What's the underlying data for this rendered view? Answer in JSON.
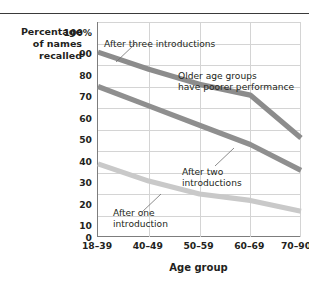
{
  "y_axis": {
    "label_lines": [
      "Percentage",
      "of names",
      "recalled"
    ],
    "ticks": [
      "100%",
      "90",
      "80",
      "70",
      "60",
      "50",
      "40",
      "30",
      "20",
      "10",
      "0"
    ]
  },
  "x_axis": {
    "title": "Age group",
    "ticks": [
      "18–39",
      "40–49",
      "50–59",
      "60–69",
      "70–90"
    ]
  },
  "annotations": {
    "three": "After three introductions",
    "older_line1": "Older age groups",
    "older_line2": "have poorer performance",
    "two_line1": "After two",
    "two_line2": "introductions",
    "one_line1": "After one",
    "one_line2": "introduction"
  },
  "colors": {
    "series_three": "#8c8c8c",
    "series_two": "#8f8f8f",
    "series_one": "#c9c9c9",
    "grid": "#d4d4d4",
    "axis": "#7d7d7d",
    "text": "#231f20",
    "rule": "#3a3a3a"
  },
  "chart_data": {
    "type": "line",
    "title": "",
    "xlabel": "Age group",
    "ylabel": "Percentage of names recalled",
    "categories": [
      "18–39",
      "40–49",
      "50–59",
      "60–69",
      "70–90"
    ],
    "ylim": [
      0,
      100
    ],
    "yticks": [
      0,
      10,
      20,
      30,
      40,
      50,
      60,
      70,
      80,
      90,
      100
    ],
    "grid": true,
    "legend": "annotations",
    "series": [
      {
        "name": "After three introductions",
        "values": [
          86,
          78,
          71,
          66,
          46
        ],
        "color": "#8c8c8c"
      },
      {
        "name": "After two introductions",
        "values": [
          70,
          61,
          52,
          43,
          31
        ],
        "color": "#8f8f8f"
      },
      {
        "name": "After one introduction",
        "values": [
          34,
          26,
          20,
          17,
          12
        ],
        "color": "#c9c9c9"
      }
    ],
    "annotations": [
      "After three introductions",
      "Older age groups have poorer performance",
      "After two introductions",
      "After one introduction"
    ]
  }
}
